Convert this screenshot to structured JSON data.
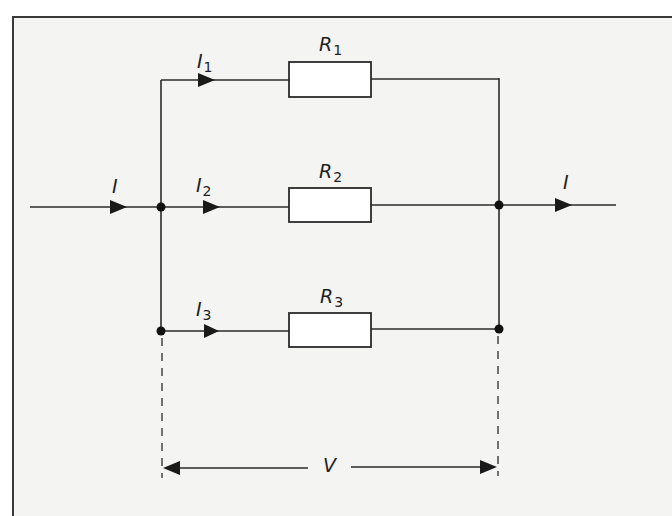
{
  "diagram": {
    "colors": {
      "background": "#f4f4f3",
      "wire": "#2b2b2b",
      "resistor_fill": "#ffffff",
      "text": "#1e1e1e"
    },
    "input_current": {
      "symbol": "I",
      "subscript": ""
    },
    "output_current": {
      "symbol": "I",
      "subscript": ""
    },
    "branches": [
      {
        "current_symbol": "I",
        "current_subscript": "1",
        "resistor_symbol": "R",
        "resistor_subscript": "1"
      },
      {
        "current_symbol": "I",
        "current_subscript": "2",
        "resistor_symbol": "R",
        "resistor_subscript": "2"
      },
      {
        "current_symbol": "I",
        "current_subscript": "3",
        "resistor_symbol": "R",
        "resistor_subscript": "3"
      }
    ],
    "voltage": {
      "symbol": "V"
    }
  }
}
